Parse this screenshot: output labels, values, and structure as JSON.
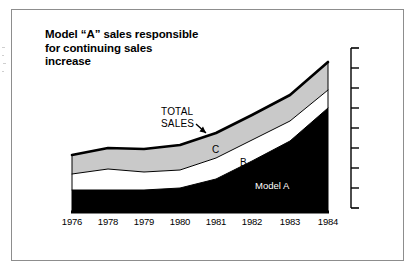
{
  "figure": {
    "title_lines": [
      "Model “A” sales responsible",
      "for continuing sales",
      "increase"
    ],
    "colors": {
      "series_a": "#000000",
      "series_b": "#ffffff",
      "series_c": "#c9c9c9",
      "outline": "#000000",
      "frame": "#8d8d8d",
      "background": "#ffffff"
    }
  },
  "annotations": {
    "total_sales_line1": "TOTAL",
    "total_sales_line2": "SALES",
    "series_c_label": "C",
    "series_b_label": "B",
    "series_a_label": "Model A"
  },
  "chart_data": {
    "type": "area",
    "stacked": true,
    "title": "Model “A” sales responsible for continuing sales increase",
    "xlabel": "",
    "ylabel": "",
    "grid": false,
    "legend": "inline-annotations",
    "axis": {
      "position": "right",
      "tick_count": 9,
      "tick_labels": [],
      "labelled": false
    },
    "categories": [
      "1976",
      "1978",
      "1979",
      "1980",
      "1981",
      "1982",
      "1983",
      "1984"
    ],
    "x_pixels": [
      72,
      108,
      144,
      180,
      216,
      252,
      290,
      328
    ],
    "series": [
      {
        "name": "Model A",
        "label": "Model A",
        "fill": "#000000",
        "values": [
          23,
          23,
          23,
          25,
          34,
          52,
          72,
          105
        ],
        "top_pixels": [
          190,
          190,
          190,
          188,
          179,
          161,
          141,
          108
        ]
      },
      {
        "name": "B",
        "label": "B",
        "fill": "#ffffff",
        "values": [
          16,
          21,
          18,
          18,
          21,
          21,
          20,
          18
        ],
        "top_pixels": [
          174,
          169,
          172,
          170,
          158,
          140,
          121,
          90
        ]
      },
      {
        "name": "C",
        "label": "C",
        "fill": "#c9c9c9",
        "values": [
          19,
          21,
          23,
          25,
          25,
          25,
          26,
          28
        ],
        "top_pixels": [
          155,
          148,
          149,
          145,
          133,
          115,
          95,
          62
        ]
      }
    ],
    "total_series": {
      "name": "TOTAL SALES",
      "values": [
        58,
        65,
        64,
        68,
        80,
        98,
        118,
        151
      ],
      "top_pixels": [
        155,
        148,
        149,
        145,
        133,
        115,
        95,
        62
      ]
    },
    "baseline_pixel": 213,
    "ylim": [
      0,
      170
    ]
  }
}
